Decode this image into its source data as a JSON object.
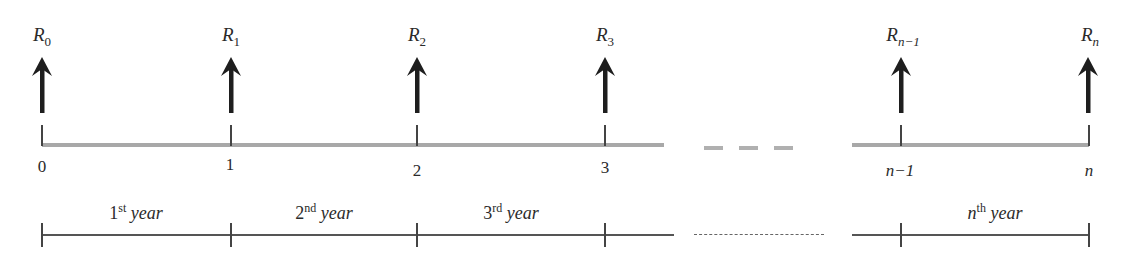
{
  "diagram": {
    "type": "cash-flow timeline",
    "cash_flows": [
      {
        "symbol": "R",
        "subscript": "0",
        "subscript_italic": false,
        "x": 42
      },
      {
        "symbol": "R",
        "subscript": "1",
        "subscript_italic": false,
        "x": 231
      },
      {
        "symbol": "R",
        "subscript": "2",
        "subscript_italic": false,
        "x": 417
      },
      {
        "symbol": "R",
        "subscript": "3",
        "subscript_italic": false,
        "x": 605
      },
      {
        "symbol": "R",
        "subscript": "n−1",
        "subscript_italic": true,
        "x": 901
      },
      {
        "symbol": "R",
        "subscript": "n",
        "subscript_italic": true,
        "x": 1088
      }
    ],
    "time_points": [
      {
        "label": "0",
        "italic": false,
        "x": 42,
        "y": 157
      },
      {
        "label": "1",
        "italic": false,
        "x": 231,
        "y": 155
      },
      {
        "label": "2",
        "italic": false,
        "x": 417,
        "y": 161
      },
      {
        "label": "3",
        "italic": false,
        "x": 605,
        "y": 158
      },
      {
        "label": "n−1",
        "italic": true,
        "x": 901,
        "y": 161
      },
      {
        "label": "n",
        "italic": true,
        "x": 1088,
        "y": 161
      }
    ],
    "periods": [
      {
        "ordinal": "1",
        "suffix": "st",
        "word": "year",
        "center_x": 136
      },
      {
        "ordinal": "2",
        "suffix": "nd",
        "word": "year",
        "center_x": 324
      },
      {
        "ordinal": "3",
        "suffix": "rd",
        "word": "year",
        "center_x": 511
      },
      {
        "ordinal": "n",
        "ordinal_italic": true,
        "suffix": "th",
        "word": "year",
        "center_x": 995
      }
    ],
    "colors": {
      "arrow": "#1e1e1e",
      "timeline_bar": "#a8a8a8",
      "year_line": "#555555",
      "text": "#2a2a2a"
    }
  }
}
